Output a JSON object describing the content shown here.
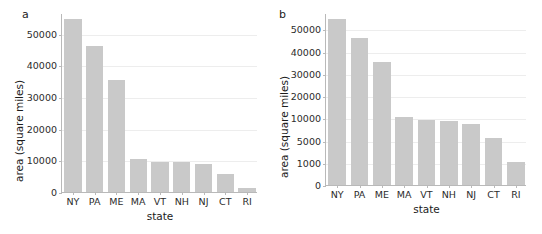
{
  "figure": {
    "panels": [
      {
        "key": "a",
        "label": "a",
        "xlabel": "state",
        "ylabel": "area (square miles)"
      },
      {
        "key": "b",
        "label": "b",
        "xlabel": "state",
        "ylabel": "area (square miles)"
      }
    ]
  },
  "chart_data": [
    {
      "type": "bar",
      "panel": "a",
      "title": "",
      "xlabel": "state",
      "ylabel": "area (square miles)",
      "categories": [
        "NY",
        "PA",
        "ME",
        "MA",
        "VT",
        "NH",
        "NJ",
        "CT",
        "RI"
      ],
      "values": [
        54555,
        46055,
        35385,
        10555,
        9620,
        9350,
        8720,
        5545,
        1210
      ],
      "yticks": [
        0,
        10000,
        20000,
        30000,
        40000,
        50000
      ],
      "ytick_labels": [
        "0",
        "10000",
        "20000",
        "30000",
        "40000",
        "50000"
      ],
      "ylim": [
        0,
        57000
      ],
      "scale": "linear",
      "grid": "horizontal",
      "legend": "none",
      "bar_color": "#c9c9c9"
    },
    {
      "type": "bar",
      "panel": "b",
      "title": "",
      "xlabel": "state",
      "ylabel": "area (square miles)",
      "categories": [
        "NY",
        "PA",
        "ME",
        "MA",
        "VT",
        "NH",
        "NJ",
        "CT",
        "RI"
      ],
      "values": [
        54555,
        46055,
        35385,
        10555,
        9620,
        9350,
        8720,
        5545,
        1210
      ],
      "yticks": [
        0,
        1000,
        5000,
        10000,
        20000,
        30000,
        40000,
        50000
      ],
      "ytick_labels": [
        "0",
        "1000",
        "5000",
        "10000",
        "20000",
        "30000",
        "40000",
        "50000"
      ],
      "ylim": [
        0,
        57000
      ],
      "scale": "nonlinear-compressed",
      "grid": "horizontal",
      "legend": "none",
      "bar_color": "#c9c9c9"
    }
  ]
}
